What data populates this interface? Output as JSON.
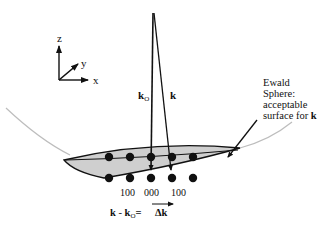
{
  "axes": {
    "z_label": "z",
    "y_label": "y",
    "x_label": "x"
  },
  "vectors": {
    "incident_label": "k",
    "incident_subscript": "O",
    "scattered_label": "k"
  },
  "ewald": {
    "line1": "Ewald",
    "line2": "Sphere:",
    "line3": "acceptable",
    "line4_text": "surface for ",
    "line4_bold": "k"
  },
  "lattice": {
    "top_row_count": 5,
    "bottom_row_count": 5,
    "index_labels": [
      "100",
      "000",
      "100"
    ]
  },
  "equation": {
    "lhs_k": "k",
    "minus": " - ",
    "lhs_k0": "k",
    "lhs_sub": "O",
    "equals": "=",
    "rhs": "Δk"
  },
  "colors": {
    "line": "#111111",
    "lens_fill": "#cfcfcf",
    "sphere_arc": "#bdbdbd"
  }
}
